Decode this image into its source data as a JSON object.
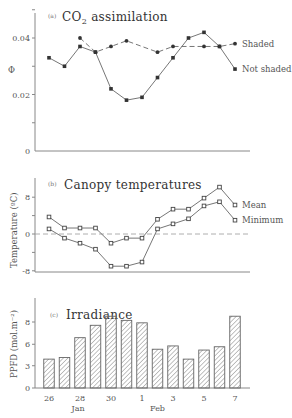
{
  "chart_data": [
    {
      "id": "a",
      "type": "line",
      "panel_tag": "(a)",
      "title": "CO2 assimilation",
      "title_main": "CO",
      "title_sub": "2",
      "title_rest": " assimilation",
      "ylabel": "Φ",
      "ylim": [
        0,
        0.05
      ],
      "yticks": [
        0,
        0.02,
        0.04
      ],
      "ytick_labels": [
        "0",
        "0.02",
        "0.04"
      ],
      "x": [
        26,
        27,
        28,
        29,
        30,
        31,
        1,
        2,
        3,
        4,
        5,
        6,
        7
      ],
      "series": [
        {
          "name": "Shaded",
          "style": "dashed",
          "marker": "circle",
          "points": [
            [
              2,
              0.04
            ],
            [
              3,
              0.035
            ],
            [
              4,
              0.037
            ],
            [
              5,
              0.039
            ],
            [
              7,
              0.035
            ],
            [
              8,
              0.037
            ],
            [
              10,
              0.037
            ],
            [
              11,
              0.037
            ],
            [
              12,
              0.038
            ]
          ]
        },
        {
          "name": "Not shaded",
          "style": "solid",
          "marker": "square",
          "points": [
            [
              0,
              0.033
            ],
            [
              1,
              0.03
            ],
            [
              2,
              0.037
            ],
            [
              3,
              0.035
            ],
            [
              4,
              0.022
            ],
            [
              5,
              0.018
            ],
            [
              6,
              0.019
            ],
            [
              7,
              0.026
            ],
            [
              8,
              0.033
            ],
            [
              9,
              0.04
            ],
            [
              10,
              0.042
            ],
            [
              11,
              0.037
            ],
            [
              12,
              0.029
            ]
          ]
        }
      ],
      "legend": [
        "Shaded",
        "Not shaded"
      ],
      "legend_position": "right"
    },
    {
      "id": "b",
      "type": "line",
      "panel_tag": "(b)",
      "title": "Canopy temperatures",
      "ylabel": "Temperature (ºC)",
      "ylim": [
        -8,
        11
      ],
      "yticks": [
        -8,
        0,
        8
      ],
      "ytick_labels": [
        "-8",
        "0",
        "8"
      ],
      "zero_line": "dashed",
      "x": [
        26,
        27,
        28,
        29,
        30,
        31,
        1,
        2,
        3,
        4,
        5,
        6,
        7
      ],
      "series": [
        {
          "name": "Mean",
          "style": "solid",
          "marker": "square",
          "values": [
            3.7,
            1.3,
            1.3,
            1.3,
            -2.0,
            -0.9,
            -0.9,
            3.2,
            5.4,
            5.4,
            7.8,
            10.2,
            6.3
          ]
        },
        {
          "name": "Minimum",
          "style": "solid",
          "marker": "square",
          "values": [
            1.1,
            -0.9,
            -2.0,
            -3.3,
            -7.0,
            -7.0,
            -6.1,
            1.1,
            2.2,
            3.3,
            6.1,
            7.0,
            3.0
          ]
        }
      ],
      "legend": [
        "Mean",
        "Minimum"
      ],
      "legend_position": "right"
    },
    {
      "id": "c",
      "type": "bar",
      "panel_tag": "(c)",
      "title": "Irradiance",
      "ylabel": "PPFD (mol.m⁻²)",
      "ylim": [
        0,
        10
      ],
      "yticks": [
        0,
        2.7,
        5.3,
        8
      ],
      "ytick_labels": [
        "0",
        "3",
        "6",
        "8"
      ],
      "categories": [
        "26",
        "27",
        "28",
        "29",
        "30",
        "31",
        "1",
        "2",
        "3",
        "4",
        "5",
        "6",
        "7"
      ],
      "values": [
        3.5,
        3.7,
        6.1,
        7.6,
        8.7,
        8.2,
        7.9,
        4.7,
        5.1,
        3.5,
        4.6,
        5.0,
        8.7
      ],
      "xtick_labels": [
        "26",
        "28",
        "30",
        "1",
        "3",
        "5",
        "7"
      ],
      "month_labels": [
        "Jan",
        "Feb"
      ],
      "bar_fill": "diagonal-hatch"
    }
  ]
}
